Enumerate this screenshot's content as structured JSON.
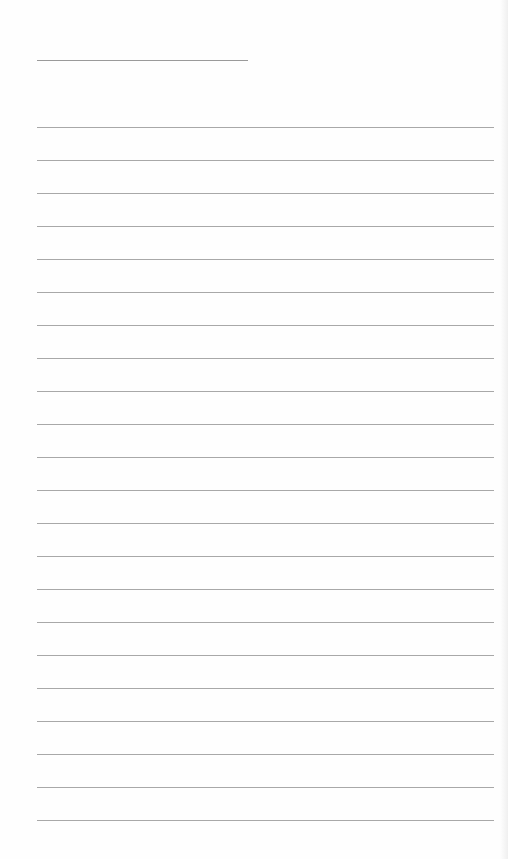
{
  "page": {
    "type": "blank lined notebook page",
    "title_line": {
      "text": ""
    },
    "rules": {
      "count": 22,
      "first_y": 127,
      "spacing": 33
    },
    "line_color": "#a8a8a8",
    "background": "#fefefe"
  }
}
